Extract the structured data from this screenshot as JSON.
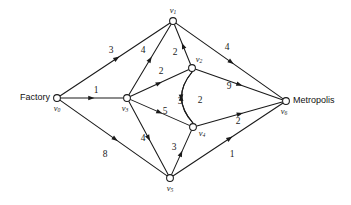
{
  "diagram": {
    "type": "directed-weighted-graph",
    "background_color": "#ffffff",
    "line_color": "#1a1a1a",
    "terminals": {
      "source_label": "Factory",
      "sink_label": "Metropolis"
    },
    "nodes": [
      {
        "id": "v0",
        "label": "v",
        "sub": "0",
        "x": 57,
        "y": 98,
        "r": 3.4,
        "label_dx": 0,
        "label_dy": 11,
        "terminal": "Factory"
      },
      {
        "id": "v1",
        "label": "v",
        "sub": "1",
        "x": 173,
        "y": 21,
        "r": 3.4,
        "label_dx": 0,
        "label_dy": -10,
        "terminal": ""
      },
      {
        "id": "v2",
        "label": "v",
        "sub": "2",
        "x": 192,
        "y": 68,
        "r": 3.4,
        "label_dx": 7,
        "label_dy": -8,
        "terminal": ""
      },
      {
        "id": "v3",
        "label": "v",
        "sub": "3",
        "x": 127,
        "y": 98,
        "r": 3.4,
        "label_dx": -2,
        "label_dy": 11,
        "terminal": ""
      },
      {
        "id": "v4",
        "label": "v",
        "sub": "4",
        "x": 193,
        "y": 127,
        "r": 3.4,
        "label_dx": 9,
        "label_dy": 7,
        "terminal": ""
      },
      {
        "id": "v5",
        "label": "v",
        "sub": "5",
        "x": 170,
        "y": 178,
        "r": 3.4,
        "label_dx": 0,
        "label_dy": 11,
        "terminal": ""
      },
      {
        "id": "v6",
        "label": "v",
        "sub": "6",
        "x": 286,
        "y": 101,
        "r": 3.4,
        "label_dx": -2,
        "label_dy": 11,
        "terminal": "Metropolis"
      }
    ],
    "edges": [
      {
        "id": "e0",
        "from": "v0",
        "to": "v1",
        "capacity": "3",
        "label_x": 111,
        "label_y": 51,
        "curved": false
      },
      {
        "id": "e1",
        "from": "v0",
        "to": "v3",
        "capacity": "1",
        "label_x": 96,
        "label_y": 91,
        "curved": false
      },
      {
        "id": "e2",
        "from": "v0",
        "to": "v5",
        "capacity": "8",
        "label_x": 105,
        "label_y": 155,
        "curved": false
      },
      {
        "id": "e3",
        "from": "v3",
        "to": "v1",
        "capacity": "4",
        "label_x": 143,
        "label_y": 51,
        "curved": false
      },
      {
        "id": "e4",
        "from": "v2",
        "to": "v1",
        "capacity": "2",
        "label_x": 175,
        "label_y": 53,
        "curved": false
      },
      {
        "id": "e5",
        "from": "v1",
        "to": "v6",
        "capacity": "4",
        "label_x": 227,
        "label_y": 48,
        "curved": false
      },
      {
        "id": "e6",
        "from": "v3",
        "to": "v2",
        "capacity": "2",
        "label_x": 161,
        "label_y": 72,
        "curved": false
      },
      {
        "id": "e7",
        "from": "v2",
        "to": "v6",
        "capacity": "9",
        "label_x": 229,
        "label_y": 87,
        "curved": false
      },
      {
        "id": "e8",
        "from": "v3",
        "to": "v4",
        "capacity": "5",
        "label_x": 165,
        "label_y": 112,
        "curved": false
      },
      {
        "id": "e9",
        "from": "v4",
        "to": "v2",
        "capacity": "3",
        "label_x": 180,
        "label_y": 102,
        "curved": true,
        "bow": -11
      },
      {
        "id": "e10",
        "from": "v2",
        "to": "v4",
        "capacity": "2",
        "label_x": 200,
        "label_y": 101,
        "curved": true,
        "bow": 11
      },
      {
        "id": "e11",
        "from": "v4",
        "to": "v6",
        "capacity": "2",
        "label_x": 238,
        "label_y": 122,
        "curved": false
      },
      {
        "id": "e12",
        "from": "v3",
        "to": "v5",
        "capacity": "4",
        "label_x": 143,
        "label_y": 139,
        "curved": false
      },
      {
        "id": "e13",
        "from": "v5",
        "to": "v4",
        "capacity": "3",
        "label_x": 174,
        "label_y": 148,
        "curved": false
      },
      {
        "id": "e14",
        "from": "v5",
        "to": "v6",
        "capacity": "1",
        "label_x": 232,
        "label_y": 155,
        "curved": false
      }
    ]
  }
}
